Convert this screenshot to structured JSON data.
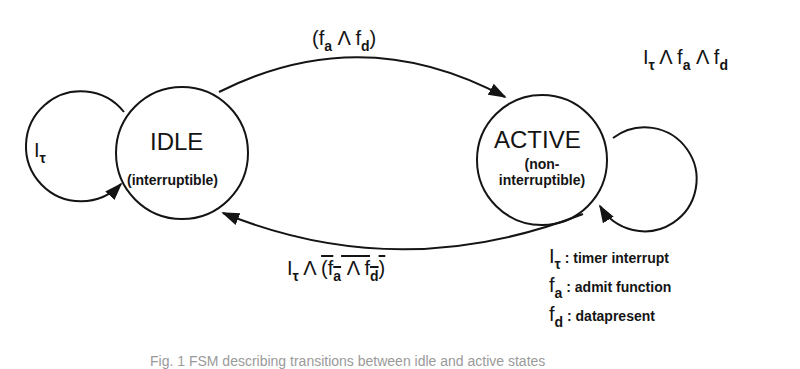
{
  "diagram": {
    "type": "finite-state-machine",
    "states": [
      {
        "id": "idle",
        "name": "IDLE",
        "subtitle": "(interruptible)"
      },
      {
        "id": "active",
        "name": "ACTIVE",
        "subtitle_line1": "(non-",
        "subtitle_line2": "interruptible)"
      }
    ],
    "transitions": [
      {
        "from": "idle",
        "to": "idle",
        "label": {
          "sym": "I",
          "sub": "τ"
        }
      },
      {
        "from": "idle",
        "to": "active",
        "label": {
          "open": "(f",
          "sub1": "a",
          "op": " Λ f",
          "sub2": "d",
          "close": ")"
        }
      },
      {
        "from": "active",
        "to": "active",
        "label": {
          "s1": "I",
          "sub1": "τ",
          "s2": " Λ f",
          "sub2": "a",
          "s3": " Λ f",
          "sub3": "d"
        }
      },
      {
        "from": "active",
        "to": "idle",
        "label": {
          "s1": "I",
          "sub1": "τ",
          "s2": " Λ ",
          "neg_open": "(f",
          "neg_sub1": "a",
          "neg_op": " Λ f",
          "neg_sub2": "d",
          "neg_close": ")"
        }
      }
    ],
    "legend": [
      {
        "sym": "I",
        "sub": "τ",
        "desc": ": timer interrupt"
      },
      {
        "sym": "f",
        "sub": "a",
        "desc": ": admit function"
      },
      {
        "sym": "f",
        "sub": "d",
        "desc": ": datapresent"
      }
    ],
    "caption": "Fig. 1 FSM describing transitions between idle and active states"
  },
  "colors": {
    "stroke": "#141414",
    "background": "#ffffff",
    "caption": "#9a9a9a"
  }
}
